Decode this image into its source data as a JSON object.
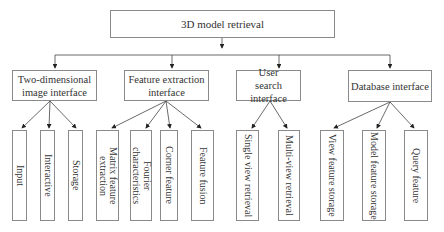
{
  "root": {
    "label": "3D model retrieval"
  },
  "modules": [
    {
      "label": "Two-dimensional image interface",
      "children": [
        "Input",
        "Interactive",
        "Storage"
      ]
    },
    {
      "label": "Feature extraction interface",
      "children": [
        "Matrix feature extraction",
        "Fourier characteristics",
        "Corner feature",
        "Feature fusion"
      ]
    },
    {
      "label": "User search interface",
      "children": [
        "Single view retrieval",
        "Multi-view retrieval"
      ]
    },
    {
      "label": "Database interface",
      "children": [
        "View feature storage",
        "Model feature storage",
        "Query feature"
      ]
    }
  ],
  "colors": {
    "line": "#333333",
    "border": "#8a8a8a",
    "text": "#333333"
  }
}
